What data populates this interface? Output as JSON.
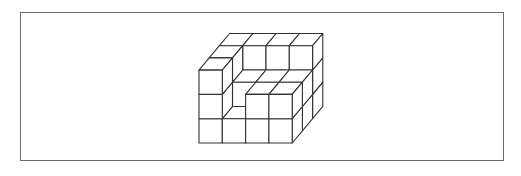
{
  "figure": {
    "frame_color": "#6b6b6b",
    "line_color": "#333333",
    "fill_color": "#ffffff"
  },
  "projection": {
    "origin_x": 199,
    "origin_y": 143,
    "cell_w": 23.3,
    "cell_h": 24.3,
    "depth_dx": 10.2,
    "depth_dy": -12.2
  },
  "voxels": [
    [
      0,
      0,
      0
    ],
    [
      1,
      0,
      0
    ],
    [
      2,
      0,
      0
    ],
    [
      3,
      0,
      0
    ],
    [
      0,
      0,
      1
    ],
    [
      1,
      0,
      1
    ],
    [
      2,
      0,
      1
    ],
    [
      3,
      0,
      1
    ],
    [
      0,
      0,
      2
    ],
    [
      1,
      0,
      2
    ],
    [
      2,
      0,
      2
    ],
    [
      3,
      0,
      2
    ],
    [
      0,
      1,
      0
    ],
    [
      2,
      1,
      0
    ],
    [
      3,
      1,
      0
    ],
    [
      0,
      1,
      1
    ],
    [
      1,
      1,
      1
    ],
    [
      2,
      1,
      1
    ],
    [
      3,
      1,
      1
    ],
    [
      0,
      1,
      2
    ],
    [
      1,
      1,
      2
    ],
    [
      2,
      1,
      2
    ],
    [
      3,
      1,
      2
    ],
    [
      0,
      2,
      0
    ],
    [
      0,
      2,
      1
    ],
    [
      0,
      2,
      2
    ],
    [
      1,
      2,
      2
    ],
    [
      2,
      2,
      2
    ],
    [
      3,
      2,
      2
    ]
  ]
}
